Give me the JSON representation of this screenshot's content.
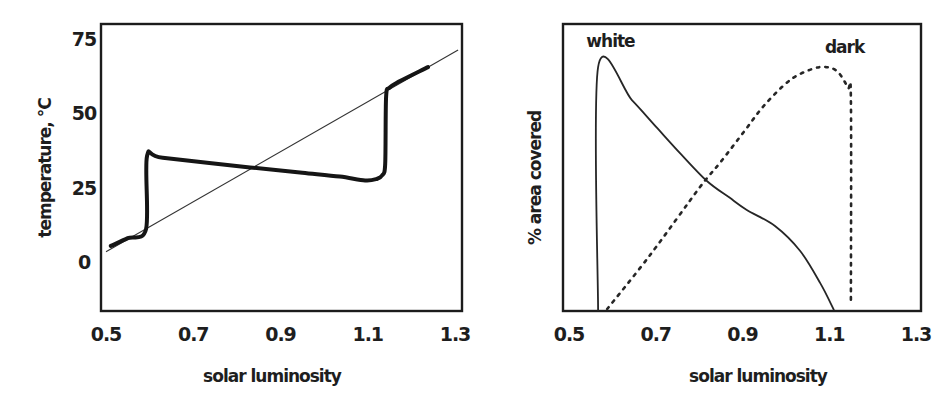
{
  "chart_data": [
    {
      "type": "line",
      "title": "",
      "xlabel": "solar luminosity",
      "ylabel": "temperature, °C",
      "xlim": [
        0.5,
        1.3
      ],
      "ylim": [
        -16.5,
        80
      ],
      "xticks": [
        "0.5",
        "0.7",
        "0.9",
        "1.1",
        "1.3"
      ],
      "xtick_values": [
        0.5,
        0.7,
        0.9,
        1.1,
        1.3
      ],
      "yticks": [
        "0",
        "25",
        "50",
        "75"
      ],
      "ytick_values": [
        0,
        25,
        50,
        75
      ],
      "grid": false,
      "series": [
        {
          "name": "temperature without life",
          "style": "thin",
          "x": [
            0.5,
            1.307
          ],
          "y": [
            3.4,
            71.3
          ]
        },
        {
          "name": "temperature with daisies",
          "style": "thick",
          "x": [
            0.511,
            0.55,
            0.592,
            0.594,
            0.63,
            0.83,
            0.95,
            1.036,
            1.094,
            1.12,
            1.133,
            1.14,
            1.142,
            1.15,
            1.174,
            1.238
          ],
          "y": [
            5.4,
            8.0,
            11.1,
            35.5,
            35.0,
            31.8,
            30.0,
            28.7,
            27.4,
            27.9,
            29.1,
            33.0,
            55.5,
            58.6,
            60.8,
            65.5
          ]
        }
      ]
    },
    {
      "type": "line",
      "title": "",
      "xlabel": "solar luminosity",
      "ylabel": "% area covered",
      "xlim": [
        0.5,
        1.3
      ],
      "ylim": [
        0,
        100
      ],
      "xticks": [
        "0.5",
        "0.7",
        "0.9",
        "1.1",
        "1.3"
      ],
      "xtick_values": [
        0.5,
        0.7,
        0.9,
        1.1,
        1.3
      ],
      "yticks": [],
      "grid": false,
      "annotations": [
        {
          "text": "white",
          "x": 0.54,
          "y": 92
        },
        {
          "text": "dark",
          "x": 1.09,
          "y": 90
        }
      ],
      "series": [
        {
          "name": "white",
          "style": "solid",
          "x": [
            0.567,
            0.567,
            0.645,
            0.703,
            0.756,
            0.818,
            0.87,
            0.91,
            0.975,
            1.033,
            1.079,
            1.111
          ],
          "y": [
            0,
            85,
            73.5,
            63.8,
            55,
            45.3,
            39.5,
            35.2,
            29.6,
            20.9,
            9.8,
            0.3
          ]
        },
        {
          "name": "dark",
          "style": "dotted",
          "x": [
            0.588,
            0.687,
            0.802,
            0.848,
            0.906,
            0.952,
            1.01,
            1.06,
            1.093,
            1.12,
            1.143,
            1.15,
            1.15
          ],
          "y": [
            0.7,
            19.5,
            43.2,
            51.6,
            63,
            72,
            80.5,
            84.3,
            85,
            83.3,
            77.7,
            73.5,
            2.1
          ]
        }
      ]
    }
  ]
}
